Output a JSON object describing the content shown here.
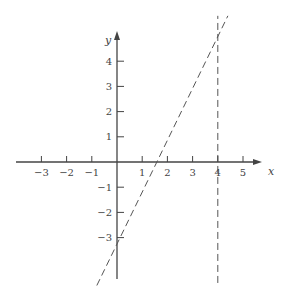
{
  "chart_data": {
    "type": "line",
    "title": "",
    "xlabel": "x",
    "ylabel": "y",
    "xlim": [
      -4,
      5.5
    ],
    "ylim": [
      -5,
      5
    ],
    "grid": false,
    "x_ticks": [
      -3,
      -2,
      -1,
      1,
      2,
      3,
      4,
      5
    ],
    "x_tick_labels": [
      "−3",
      "−2",
      "−1",
      "1",
      "2",
      "3",
      "4",
      "5"
    ],
    "y_ticks": [
      4,
      3,
      2,
      1,
      -1,
      -2,
      -3
    ],
    "y_tick_labels": [
      "4",
      "3",
      "2",
      "1",
      "−1",
      "−2",
      "−3"
    ],
    "series": [
      {
        "name": "y = 2x - 3",
        "style": "dashed",
        "x": [
          -0.8,
          4.4
        ],
        "y": [
          -4.9,
          5.8
        ]
      },
      {
        "name": "x = 4",
        "style": "dashed",
        "x": [
          4,
          4
        ],
        "y": [
          -4.8,
          5.8
        ]
      }
    ],
    "annotations": []
  },
  "colors": {
    "axis": "#444444",
    "line": "#555555",
    "background": "#ffffff"
  }
}
